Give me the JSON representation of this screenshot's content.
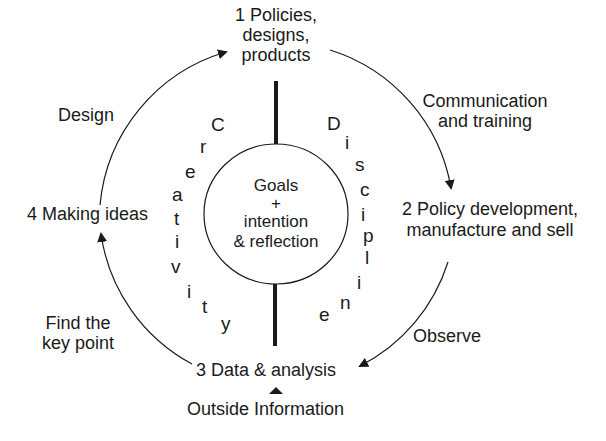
{
  "diagram": {
    "nodes": {
      "node1": [
        "1 Policies,",
        "designs,",
        "products"
      ],
      "node2": [
        "2 Policy development,",
        "manufacture and sell"
      ],
      "node3": "3 Data & analysis",
      "node4": "4 Making ideas"
    },
    "edges": {
      "design": "Design",
      "communication": [
        "Communication",
        "and training"
      ],
      "observe": "Observe",
      "find_key_point": [
        "Find the",
        "key point"
      ]
    },
    "external_input": "Outside Information",
    "center": [
      "Goals",
      "+",
      "intention",
      "& reflection"
    ],
    "left_arc_word": "Creativity",
    "right_arc_word": "Discipline",
    "line_color": "#1a1a1a"
  }
}
